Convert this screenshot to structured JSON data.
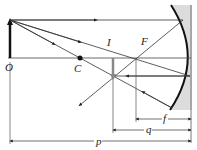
{
  "diagram": {
    "labels": {
      "object": "O",
      "center": "C",
      "image": "I",
      "focal_point": "F",
      "focal_length": "f",
      "image_distance": "q",
      "object_distance": "p"
    },
    "colors": {
      "line": "#333333",
      "mirror": "#111111",
      "mirror_fill": "#dcdcdc",
      "image_arrow": "#888888"
    }
  }
}
